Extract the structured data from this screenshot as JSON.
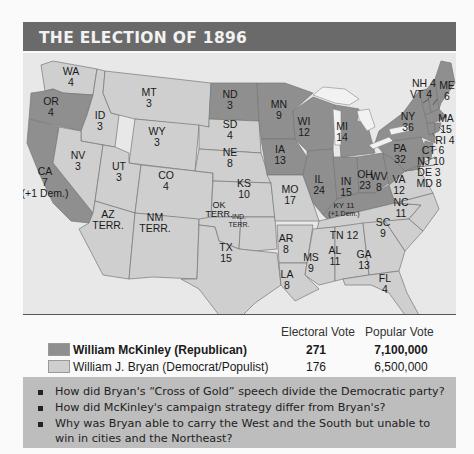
{
  "title": "THE ELECTION OF 1896",
  "colors": {
    "header": "#6a6a6a",
    "republican": "#8f8f8f",
    "democrat": "#cfcfcf",
    "question_box": "#bdbdbd"
  },
  "states": {
    "WA": {
      "name": "WA",
      "votes": "4",
      "party": "democrat"
    },
    "OR": {
      "name": "OR",
      "votes": "4",
      "party": "republican"
    },
    "CA": {
      "name": "CA",
      "votes": "7",
      "note": "(+1 Dem.)",
      "party": "republican"
    },
    "ID": {
      "name": "ID",
      "votes": "3",
      "party": "democrat"
    },
    "NV": {
      "name": "NV",
      "votes": "3",
      "party": "democrat"
    },
    "MT": {
      "name": "MT",
      "votes": "3",
      "party": "democrat"
    },
    "WY": {
      "name": "WY",
      "votes": "3",
      "party": "democrat"
    },
    "UT": {
      "name": "UT",
      "votes": "3",
      "party": "democrat"
    },
    "CO": {
      "name": "CO",
      "votes": "4",
      "party": "democrat"
    },
    "AZ": {
      "name": "AZ",
      "votes": "TERR.",
      "party": "territory"
    },
    "NM": {
      "name": "NM",
      "votes": "TERR.",
      "party": "territory"
    },
    "ND": {
      "name": "ND",
      "votes": "3",
      "party": "republican"
    },
    "SD": {
      "name": "SD",
      "votes": "4",
      "party": "democrat"
    },
    "NE": {
      "name": "NE",
      "votes": "8",
      "party": "democrat"
    },
    "KS": {
      "name": "KS",
      "votes": "10",
      "party": "democrat"
    },
    "OK": {
      "name": "OK",
      "votes": "TERR.",
      "party": "territory"
    },
    "IND": {
      "name": "IND.",
      "votes": "TERR.",
      "party": "territory"
    },
    "TX": {
      "name": "TX",
      "votes": "15",
      "party": "democrat"
    },
    "MN": {
      "name": "MN",
      "votes": "9",
      "party": "republican"
    },
    "IA": {
      "name": "IA",
      "votes": "13",
      "party": "republican"
    },
    "MO": {
      "name": "MO",
      "votes": "17",
      "party": "democrat"
    },
    "AR": {
      "name": "AR",
      "votes": "8",
      "party": "democrat"
    },
    "LA": {
      "name": "LA",
      "votes": "8",
      "party": "democrat"
    },
    "WI": {
      "name": "WI",
      "votes": "12",
      "party": "republican"
    },
    "IL": {
      "name": "IL",
      "votes": "24",
      "party": "republican"
    },
    "MI": {
      "name": "MI",
      "votes": "14",
      "party": "republican"
    },
    "IN": {
      "name": "IN",
      "votes": "15",
      "party": "republican"
    },
    "OH": {
      "name": "OH",
      "votes": "23",
      "party": "republican"
    },
    "KY": {
      "name": "KY 11",
      "note": "(+1 Dem.)",
      "party": "republican"
    },
    "TN": {
      "name": "TN 12",
      "party": "democrat"
    },
    "MS": {
      "name": "MS",
      "votes": "9",
      "party": "democrat"
    },
    "AL": {
      "name": "AL",
      "votes": "11",
      "party": "democrat"
    },
    "GA": {
      "name": "GA",
      "votes": "13",
      "party": "democrat"
    },
    "FL": {
      "name": "FL",
      "votes": "4",
      "party": "democrat"
    },
    "SC": {
      "name": "SC",
      "votes": "9",
      "party": "democrat"
    },
    "NC": {
      "name": "NC",
      "votes": "11",
      "party": "democrat"
    },
    "VA": {
      "name": "VA",
      "votes": "12",
      "party": "democrat"
    },
    "WV": {
      "name": "WV",
      "votes": "8",
      "party": "republican"
    },
    "PA": {
      "name": "PA",
      "votes": "32",
      "party": "republican"
    },
    "NY": {
      "name": "NY",
      "votes": "36",
      "party": "republican"
    },
    "ME": {
      "name": "ME",
      "votes": "6",
      "party": "republican"
    },
    "NH": {
      "label": "NH 4",
      "party": "republican"
    },
    "VT": {
      "label": "VT 4",
      "party": "republican"
    },
    "MA": {
      "name": "MA",
      "votes": "15",
      "party": "republican"
    },
    "RI": {
      "label": "RI 4",
      "party": "republican"
    },
    "CT": {
      "label": "CT 6",
      "party": "republican"
    },
    "NJ": {
      "label": "NJ 10",
      "party": "republican"
    },
    "DE": {
      "label": "DE 3",
      "party": "republican"
    },
    "MD": {
      "label": "MD 8",
      "party": "republican"
    }
  },
  "legend": {
    "electoral_header": "Electoral Vote",
    "popular_header": "Popular Vote",
    "rows": [
      {
        "candidate": "William McKinley (Republican)",
        "electoral": "271",
        "popular": "7,100,000"
      },
      {
        "candidate": "William J. Bryan (Democrat/Populist)",
        "electoral": "176",
        "popular": "6,500,000"
      }
    ]
  },
  "questions": [
    "How did Bryan's “Cross of Gold” speech divide the Democratic party?",
    "How did McKinley's campaign strategy differ from Bryan's?",
    "Why was Bryan able to carry the West and the South but unable to win in cities and the Northeast?"
  ]
}
